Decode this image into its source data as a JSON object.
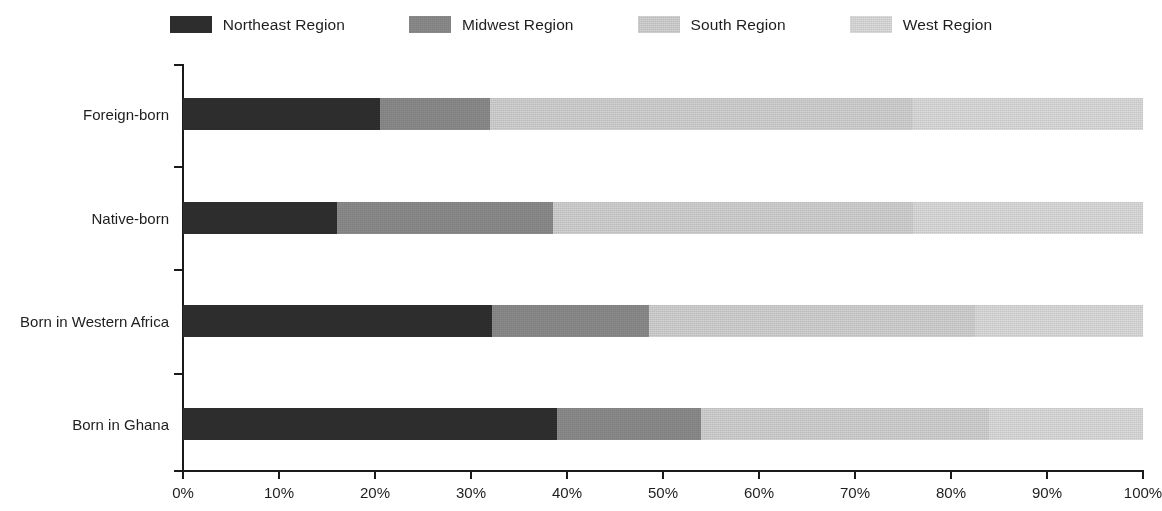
{
  "chart_data": {
    "type": "bar",
    "orientation": "horizontal",
    "stacked": true,
    "normalized": true,
    "title": "",
    "subtitle": "",
    "xlabel": "",
    "ylabel": "",
    "xlim": [
      0,
      100
    ],
    "xticks": [
      "0%",
      "10%",
      "20%",
      "30%",
      "40%",
      "50%",
      "60%",
      "70%",
      "80%",
      "90%",
      "100%"
    ],
    "xtick_values": [
      0,
      10,
      20,
      30,
      40,
      50,
      60,
      70,
      80,
      90,
      100
    ],
    "grid": false,
    "legend_position": "top-center",
    "categories": [
      "Foreign-born",
      "Native-born",
      "Born in Western Africa",
      "Born in Ghana"
    ],
    "series": [
      {
        "name": "Northeast Region",
        "color": "#2f2f2f",
        "values": [
          20.5,
          16.0,
          32.2,
          39.0
        ]
      },
      {
        "name": "Midwest Region",
        "color": "#8c8c8c",
        "values": [
          11.5,
          22.5,
          16.3,
          15.0
        ]
      },
      {
        "name": "South Region",
        "color": "#d2d2d2",
        "values": [
          44.0,
          37.5,
          34.0,
          30.0
        ]
      },
      {
        "name": "West Region",
        "color": "#dcdcdc",
        "values": [
          24.0,
          24.0,
          17.5,
          16.0
        ]
      }
    ]
  },
  "legend": {
    "items": [
      {
        "label": "Northeast Region"
      },
      {
        "label": "Midwest Region"
      },
      {
        "label": "South Region"
      },
      {
        "label": "West Region"
      }
    ]
  },
  "axis": {
    "x_labels": [
      "0%",
      "10%",
      "20%",
      "30%",
      "40%",
      "50%",
      "60%",
      "70%",
      "80%",
      "90%",
      "100%"
    ],
    "y_labels": [
      "Foreign-born",
      "Native-born",
      "Born in Western Africa",
      "Born in Ghana"
    ]
  },
  "colors": {
    "northeast": "#2f2f2f",
    "midwest": "#8c8c8c",
    "south": "#d2d2d2",
    "west": "#dcdcdc",
    "axis": "#1a1a1a",
    "text": "#1f1d1e",
    "background": "#ffffff"
  }
}
